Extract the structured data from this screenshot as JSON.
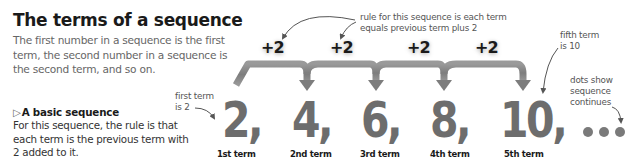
{
  "header": {
    "title": "The terms of a sequence",
    "intro": "The first number in a sequence is the first term, the second number in a sequence is the second term, and so on."
  },
  "basic_sequence": {
    "marker": "▷",
    "heading": "A basic sequence",
    "body": "For this sequence, the rule is that each term is the previous term with 2 added to it."
  },
  "annotations": {
    "rule": [
      "rule for this sequence is each term",
      "equals previous term plus 2"
    ],
    "first_term": [
      "first term",
      "is 2"
    ],
    "fifth_term": [
      "fifth term",
      "is 10"
    ],
    "dots": [
      "dots show",
      "sequence",
      "continues"
    ]
  },
  "increments": [
    "+2",
    "+2",
    "+2",
    "+2"
  ],
  "terms": [
    {
      "value": "2,",
      "label": "1st term"
    },
    {
      "value": "4,",
      "label": "2nd term"
    },
    {
      "value": "6,",
      "label": "3rd term"
    },
    {
      "value": "8,",
      "label": "4th term"
    },
    {
      "value": "10,",
      "label": "5th term"
    }
  ],
  "continuation": "…",
  "colors": {
    "term_gray": "#6d6d6d",
    "arrow_gray": "#8a8a8a",
    "text_dark": "#1a1a1a",
    "text_muted": "#666666"
  }
}
